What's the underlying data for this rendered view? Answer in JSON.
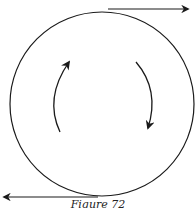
{
  "figure": {
    "caption": "Figure 72",
    "stroke_color": "#1a1a1a",
    "background": "#ffffff",
    "circle": {
      "cx": 102,
      "cy": 104,
      "r": 92
    },
    "tangent_arrows": [
      {
        "name": "top-tangent-arrow",
        "direction": "right"
      },
      {
        "name": "bottom-tangent-arrow",
        "direction": "left"
      }
    ],
    "rotation_arrows": [
      {
        "name": "left-rotation-arrow",
        "direction": "up"
      },
      {
        "name": "right-rotation-arrow",
        "direction": "down"
      }
    ],
    "rotation_sense": "clockwise"
  }
}
